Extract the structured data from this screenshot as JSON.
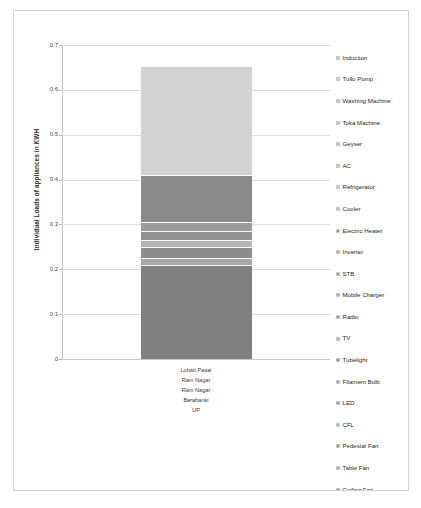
{
  "chart_data": {
    "type": "bar",
    "subtype": "stacked-column",
    "title": "",
    "xlabel": "",
    "ylabel": "Individual Loads of appliances in KWH",
    "ylim": [
      0,
      0.7
    ],
    "ytick_labels": [
      "0.7",
      "0.6",
      "0.5",
      "0.4",
      "0.3",
      "0.2",
      "0.1",
      "0"
    ],
    "ytick_values": [
      0.7,
      0.6,
      0.5,
      0.4,
      0.3,
      0.2,
      0.1,
      0
    ],
    "grid": true,
    "legend_position": "right",
    "categories": [
      "Lohatt Pasai"
    ],
    "category_hierarchy": [
      "Lohatt Pasai",
      "Ram Nagar",
      "Ram Nagar",
      "Barabanki",
      "UP"
    ],
    "total": 0.653,
    "series": [
      {
        "name": "Ceiling Fan",
        "values": [
          0.21
        ],
        "color": "#808080"
      },
      {
        "name": "Table Fan",
        "values": [
          0.015
        ],
        "color": "#a8a8a8"
      },
      {
        "name": "Pedestal Fan",
        "values": [
          0.025
        ],
        "color": "#8c8c8c"
      },
      {
        "name": "CFL",
        "values": [
          0.015
        ],
        "color": "#b4b4b4"
      },
      {
        "name": "LED",
        "values": [
          0.02
        ],
        "color": "#909090"
      },
      {
        "name": "Filament Bulb",
        "values": [
          0.02
        ],
        "color": "#9c9c9c"
      },
      {
        "name": "Tubelight",
        "values": [
          0.105
        ],
        "color": "#8a8a8a"
      },
      {
        "name": "TV",
        "values": [
          0.0
        ],
        "color": "#b0b0b0"
      },
      {
        "name": "Radio",
        "values": [
          0.0
        ],
        "color": "#989898"
      },
      {
        "name": "Mobile Charger",
        "values": [
          0.0
        ],
        "color": "#a4a4a4"
      },
      {
        "name": "STB",
        "values": [
          0.0
        ],
        "color": "#9a9a9a"
      },
      {
        "name": "Inverter",
        "values": [
          0.0
        ],
        "color": "#adadad"
      },
      {
        "name": "Electric Heater",
        "values": [
          0.0
        ],
        "color": "#959595"
      },
      {
        "name": "Cooler",
        "values": [
          0.0
        ],
        "color": "#c0c0c0"
      },
      {
        "name": "Refrigerator",
        "values": [
          0.243
        ],
        "color": "#d2d2d2"
      },
      {
        "name": "AC",
        "values": [
          0.0
        ],
        "color": "#c8c8c8"
      },
      {
        "name": "Geyser",
        "values": [
          0.0
        ],
        "color": "#bcbcbc"
      },
      {
        "name": "Toka Machine",
        "values": [
          0.0
        ],
        "color": "#c4c4c4"
      },
      {
        "name": "Washing Machine",
        "values": [
          0.0
        ],
        "color": "#bebebe"
      },
      {
        "name": "Tullu Pump",
        "values": [
          0.0
        ],
        "color": "#cacaca"
      },
      {
        "name": "Induction",
        "values": [
          0.0
        ],
        "color": "#d6d6d6"
      }
    ]
  },
  "axis": {
    "y_title": "Individual Loads of appliances in KWH",
    "ticks": [
      {
        "label": "0.7",
        "value": 0.7
      },
      {
        "label": "0.6",
        "value": 0.6
      },
      {
        "label": "0.5",
        "value": 0.5
      },
      {
        "label": "0.4",
        "value": 0.4
      },
      {
        "label": "0.3",
        "value": 0.3
      },
      {
        "label": "0.2",
        "value": 0.2
      },
      {
        "label": "0.1",
        "value": 0.1
      },
      {
        "label": "0",
        "value": 0.0
      }
    ]
  },
  "category_labels": [
    "Lohatt Pasai",
    "Ram Nagar",
    "Ram Nagar",
    "Barabanki",
    "UP"
  ],
  "legend": {
    "items": [
      {
        "label": "Induction",
        "color": "#d6d6d6"
      },
      {
        "label": "Tullu Pump",
        "color": "#cacaca"
      },
      {
        "label": "Washing Machine",
        "color": "#bebebe"
      },
      {
        "label": "Toka Machine",
        "color": "#c4c4c4"
      },
      {
        "label": "Geyser",
        "color": "#bcbcbc"
      },
      {
        "label": "AC",
        "color": "#c8c8c8"
      },
      {
        "label": "Refrigerator",
        "color": "#d2d2d2"
      },
      {
        "label": "Cooler",
        "color": "#c0c0c0"
      },
      {
        "label": "Electric Heater",
        "color": "#959595"
      },
      {
        "label": "Inverter",
        "color": "#adadad"
      },
      {
        "label": "STB",
        "color": "#9a9a9a"
      },
      {
        "label": "Mobile Charger",
        "color": "#a4a4a4"
      },
      {
        "label": "Radio",
        "color": "#989898"
      },
      {
        "label": "TV",
        "color": "#b0b0b0"
      },
      {
        "label": "Tubelight",
        "color": "#8a8a8a"
      },
      {
        "label": "Filament Bulb",
        "color": "#9c9c9c"
      },
      {
        "label": "LED",
        "color": "#909090"
      },
      {
        "label": "CFL",
        "color": "#b4b4b4"
      },
      {
        "label": "Pedestal Fan",
        "color": "#8c8c8c"
      },
      {
        "label": "Table Fan",
        "color": "#a8a8a8"
      },
      {
        "label": "Ceiling Fan",
        "color": "#808080"
      }
    ]
  }
}
